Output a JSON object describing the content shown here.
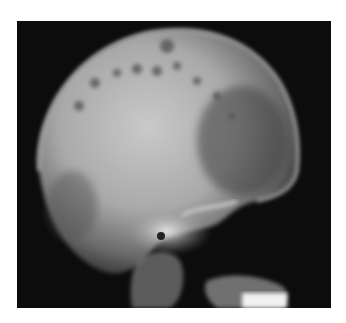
{
  "figure": {
    "background_color": "#ffffff",
    "film_color": "#0c0c0c"
  }
}
